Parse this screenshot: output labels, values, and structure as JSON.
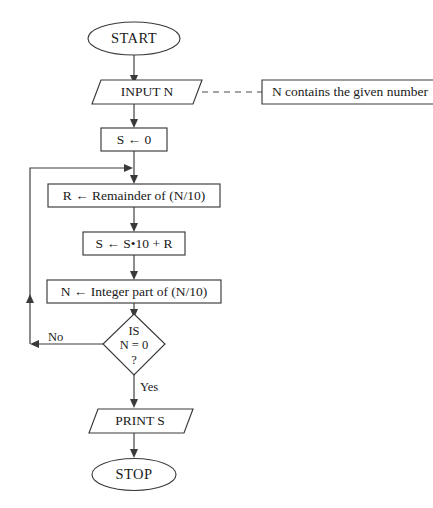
{
  "diagram": {
    "stroke_color": "#3a3a3a",
    "text_color": "#1a1a1a",
    "background_color": "#ffffff"
  },
  "nodes": {
    "start": {
      "label": "START",
      "shape": "terminal"
    },
    "input_n": {
      "label": "INPUT N",
      "shape": "parallelogram"
    },
    "annotation": {
      "label": "N contains the given number",
      "shape": "annotation-box"
    },
    "init_s": {
      "label": "S ← 0",
      "shape": "process"
    },
    "remainder": {
      "label": "R ← Remainder of (N/10)",
      "shape": "process"
    },
    "accumulate": {
      "label": "S ← S•10 + R",
      "shape": "process"
    },
    "integer_part": {
      "label": "N ← Integer part of (N/10)",
      "shape": "process"
    },
    "decision": {
      "shape": "diamond",
      "line1": "IS",
      "line2": "N = 0",
      "line3": "?"
    },
    "print_s": {
      "label": "PRINT S",
      "shape": "parallelogram"
    },
    "stop": {
      "label": "STOP",
      "shape": "terminal"
    }
  },
  "edge_labels": {
    "no": "No",
    "yes": "Yes"
  }
}
